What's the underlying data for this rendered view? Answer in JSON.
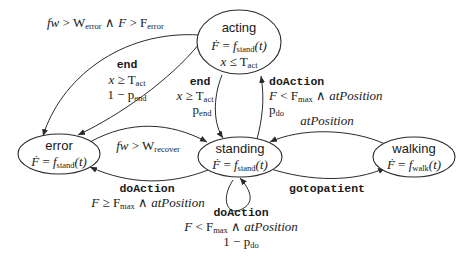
{
  "diagram": {
    "type": "state-machine",
    "states": [
      {
        "id": "acting",
        "label": "acting",
        "dynamics": {
          "lhs": "Ḟ",
          "eq": "=",
          "fn": "f",
          "fn_sub": "stand",
          "arg": "(t)"
        },
        "invariant": {
          "var": "x",
          "op": "≤",
          "const": "T",
          "const_sub": "act"
        }
      },
      {
        "id": "error",
        "label": "error",
        "dynamics": {
          "lhs": "Ḟ",
          "eq": "=",
          "fn": "f",
          "fn_sub": "stand",
          "arg": "(t)"
        }
      },
      {
        "id": "standing",
        "label": "standing",
        "dynamics": {
          "lhs": "Ḟ",
          "eq": "=",
          "fn": "f",
          "fn_sub": "stand",
          "arg": "(t)"
        }
      },
      {
        "id": "walking",
        "label": "walking",
        "dynamics": {
          "lhs": "Ḟ",
          "eq": "=",
          "fn": "f",
          "fn_sub": "walk",
          "arg": "(t)"
        }
      }
    ],
    "transitions": [
      {
        "id": "acting-to-error-guard",
        "from": "acting",
        "to": "error",
        "guard": {
          "a": "fw",
          "op1": ">",
          "b": "W",
          "b_sub": "error",
          "and": "∧",
          "c": "F",
          "op2": ">",
          "d": "F",
          "d_sub": "error"
        }
      },
      {
        "id": "acting-to-error-end",
        "from": "acting",
        "to": "error",
        "action": "end",
        "guard": {
          "var": "x",
          "op": "≥",
          "const": "T",
          "const_sub": "act"
        },
        "prob": {
          "prefix": "1 − ",
          "p": "p",
          "p_sub": "end"
        }
      },
      {
        "id": "acting-to-standing-end",
        "from": "acting",
        "to": "standing",
        "action": "end",
        "guard": {
          "var": "x",
          "op": "≥",
          "const": "T",
          "const_sub": "act"
        },
        "prob": {
          "p": "p",
          "p_sub": "end"
        }
      },
      {
        "id": "standing-to-acting",
        "from": "standing",
        "to": "acting",
        "action": "doAction",
        "guard": {
          "a": "F",
          "op": "<",
          "b": "F",
          "b_sub": "max",
          "and": "∧",
          "c": "atPosition"
        },
        "prob": {
          "p": "p",
          "p_sub": "do"
        }
      },
      {
        "id": "error-to-standing",
        "from": "error",
        "to": "standing",
        "guard": {
          "a": "fw",
          "op": ">",
          "b": "W",
          "b_sub": "recover"
        }
      },
      {
        "id": "standing-to-error",
        "from": "standing",
        "to": "error",
        "action": "doAction",
        "guard": {
          "a": "F",
          "op": "≥",
          "b": "F",
          "b_sub": "max",
          "and": "∧",
          "c": "atPosition"
        }
      },
      {
        "id": "standing-self-loop",
        "from": "standing",
        "to": "standing",
        "action": "doAction",
        "guard": {
          "a": "F",
          "op": "<",
          "b": "F",
          "b_sub": "max",
          "and": "∧",
          "c": "atPosition"
        },
        "prob": {
          "prefix": "1 − ",
          "p": "p",
          "p_sub": "do"
        }
      },
      {
        "id": "walking-to-standing",
        "from": "walking",
        "to": "standing",
        "guard": {
          "c": "atPosition"
        }
      },
      {
        "id": "standing-to-walking",
        "from": "standing",
        "to": "walking",
        "action": "gotopatient"
      }
    ]
  }
}
